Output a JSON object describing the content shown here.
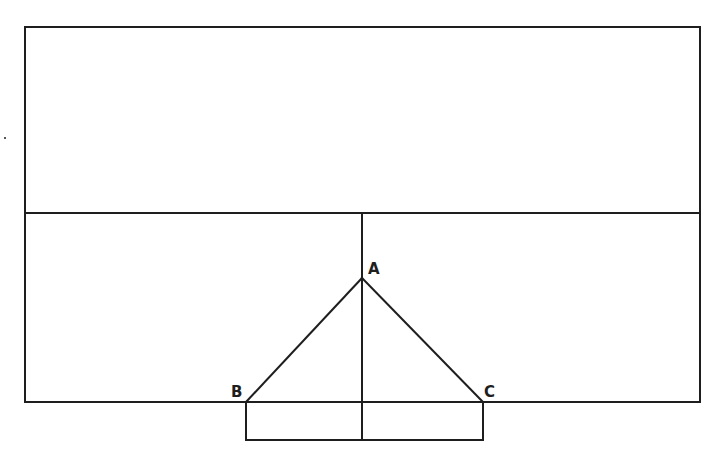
{
  "diagram": {
    "labels": {
      "a": "A",
      "b": "B",
      "c": "C"
    },
    "line_color": "#1e1e1e",
    "background": "#ffffff"
  }
}
